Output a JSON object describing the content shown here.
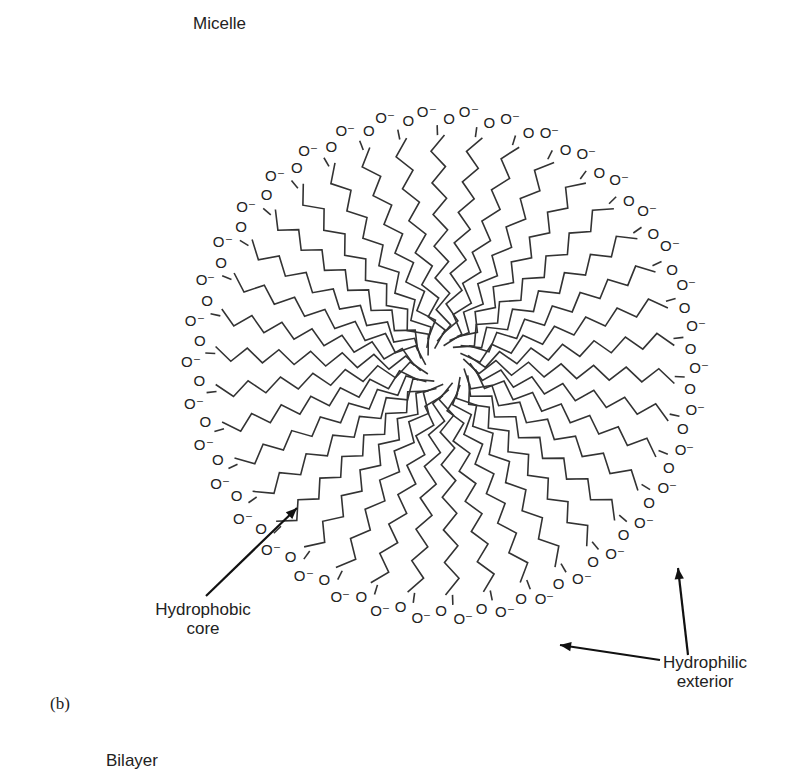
{
  "figure": {
    "title": "Micelle",
    "panel_label": "(b)",
    "next_title": "Bilayer",
    "labels": {
      "hydrophobic": [
        "Hydrophobic",
        "core"
      ],
      "hydrophilic": [
        "Hydrophilic",
        "exterior"
      ]
    },
    "head_group": {
      "carbonyl": "O",
      "anion": "O⁻"
    },
    "micelle": {
      "center": [
        445,
        365
      ],
      "inner_radius": 18,
      "outer_radius": 270,
      "chain_count": 38,
      "zigzag_amplitude": 7,
      "segments": 13,
      "line_color": "#333333"
    },
    "arrows": [
      {
        "name": "hydrophobic-arrow",
        "from": [
          206,
          596
        ],
        "to": [
          297,
          508
        ]
      },
      {
        "name": "hydrophilic-arrow-1",
        "from": [
          660,
          660
        ],
        "to": [
          560,
          645
        ]
      },
      {
        "name": "hydrophilic-arrow-2",
        "from": [
          688,
          655
        ],
        "to": [
          678,
          568
        ]
      }
    ]
  }
}
